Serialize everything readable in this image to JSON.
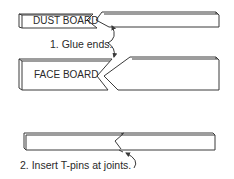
{
  "diagram": {
    "boards": {
      "dust_board": {
        "label": "DUST BOARD"
      },
      "face_board": {
        "label": "FACE BOARD"
      }
    },
    "steps": [
      {
        "label": "1. Glue ends."
      },
      {
        "label": "2. Insert T-pins at joints."
      }
    ],
    "colors": {
      "line": "#3a3a3a",
      "background": "#ffffff",
      "text": "#2a2a2a"
    }
  }
}
